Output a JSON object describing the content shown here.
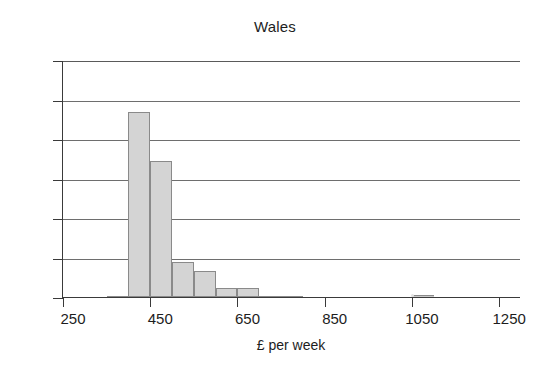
{
  "chart_data": {
    "type": "bar",
    "title": "Wales",
    "xlabel": "£ per week",
    "ylabel": "",
    "xlim": [
      250,
      1300
    ],
    "ylim": [
      0,
      60
    ],
    "grid": true,
    "legend": null,
    "bin_width": 50,
    "x_ticks": [
      250,
      450,
      650,
      850,
      1050,
      1250
    ],
    "x_tick_labels": [
      "250",
      "450",
      "650",
      "850",
      "1050",
      "1250"
    ],
    "y_ticks": [
      0,
      10,
      20,
      30,
      40,
      50,
      60
    ],
    "y_tick_labels": [
      "0",
      "10",
      "20",
      "30",
      "40",
      "50",
      "60"
    ],
    "bins": [
      {
        "start": 350,
        "end": 400,
        "value": 0.3
      },
      {
        "start": 400,
        "end": 450,
        "value": 46.8
      },
      {
        "start": 450,
        "end": 500,
        "value": 34.4
      },
      {
        "start": 500,
        "end": 550,
        "value": 8.9
      },
      {
        "start": 550,
        "end": 600,
        "value": 6.6
      },
      {
        "start": 600,
        "end": 650,
        "value": 2.2
      },
      {
        "start": 650,
        "end": 700,
        "value": 2.2
      },
      {
        "start": 700,
        "end": 750,
        "value": 0.3
      },
      {
        "start": 750,
        "end": 800,
        "value": 0.3
      },
      {
        "start": 1050,
        "end": 1100,
        "value": 0.5
      }
    ],
    "categories": [
      "350-400",
      "400-450",
      "450-500",
      "500-550",
      "550-600",
      "600-650",
      "650-700",
      "700-750",
      "750-800",
      "1050-1100"
    ],
    "values": [
      0.3,
      46.8,
      34.4,
      8.9,
      6.6,
      2.2,
      2.2,
      0.3,
      0.3,
      0.5
    ],
    "colors": {
      "bar_fill": "#d4d4d4",
      "bar_edge": "#8a8a8a",
      "axis": "#3a3a3a",
      "grid": "#6e6e6e",
      "text": "#1d1d1d",
      "background": "#ffffff"
    }
  }
}
